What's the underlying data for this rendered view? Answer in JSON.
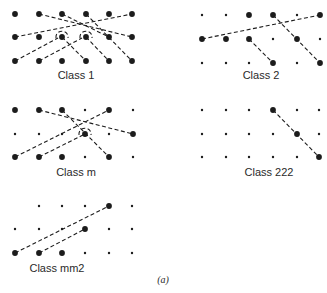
{
  "caption": "(a)",
  "colors": {
    "ink": "#1c1c1c",
    "text": "#2a2a2a",
    "background": "#ffffff"
  },
  "panels": [
    {
      "id": "class-1",
      "label": "Class 1",
      "label_pos": [
        76,
        79
      ],
      "xs": [
        15,
        39,
        62,
        86,
        109,
        132
      ],
      "ys": [
        14,
        37,
        61
      ],
      "large": [
        [
          0,
          0
        ],
        [
          1,
          0
        ],
        [
          2,
          0
        ],
        [
          3,
          0
        ],
        [
          4,
          0
        ],
        [
          5,
          0
        ],
        [
          0,
          1
        ],
        [
          1,
          1
        ],
        [
          2,
          1
        ],
        [
          3,
          1
        ],
        [
          4,
          1
        ],
        [
          5,
          1
        ],
        [
          0,
          2
        ],
        [
          1,
          2
        ],
        [
          2,
          2
        ],
        [
          3,
          2
        ],
        [
          4,
          2
        ],
        [
          5,
          2
        ]
      ],
      "lines": [
        [
          [
            39,
            14
          ],
          [
            132,
            37
          ]
        ],
        [
          [
            15,
            37
          ],
          [
            132,
            14
          ]
        ],
        [
          [
            62,
            14
          ],
          [
            109,
            37
          ]
        ],
        [
          [
            62,
            37
          ],
          [
            86,
            61
          ]
        ],
        [
          [
            86,
            37
          ],
          [
            109,
            61
          ]
        ],
        [
          [
            86,
            14
          ],
          [
            132,
            61
          ]
        ],
        [
          [
            15,
            61
          ],
          [
            58,
            38
          ]
        ],
        [
          [
            39,
            61
          ],
          [
            82,
            38
          ]
        ]
      ],
      "loops": [
        [
          62,
          37
        ],
        [
          86,
          37
        ]
      ]
    },
    {
      "id": "class-2",
      "label": "Class 2",
      "label_pos": [
        261,
        79
      ],
      "xs": [
        202,
        226,
        249,
        273,
        297,
        320
      ],
      "ys": [
        15,
        39,
        63
      ],
      "large": [
        [
          2,
          0
        ],
        [
          3,
          0
        ],
        [
          5,
          0
        ],
        [
          0,
          1
        ],
        [
          1,
          1
        ],
        [
          2,
          1
        ],
        [
          4,
          1
        ],
        [
          3,
          2
        ],
        [
          5,
          2
        ]
      ],
      "lines": [
        [
          [
            202,
            39
          ],
          [
            320,
            15
          ]
        ],
        [
          [
            273,
            15
          ],
          [
            320,
            63
          ]
        ],
        [
          [
            249,
            39
          ],
          [
            273,
            63
          ]
        ]
      ],
      "loops": []
    },
    {
      "id": "class-m",
      "label": "Class m",
      "label_pos": [
        76,
        176
      ],
      "xs": [
        15,
        39,
        62,
        85,
        109,
        133
      ],
      "ys": [
        110,
        134,
        157
      ],
      "large": [
        [
          0,
          0
        ],
        [
          1,
          0
        ],
        [
          2,
          0
        ],
        [
          4,
          0
        ],
        [
          5,
          1
        ],
        [
          3,
          1
        ],
        [
          0,
          2
        ],
        [
          1,
          2
        ],
        [
          2,
          2
        ],
        [
          4,
          2
        ]
      ],
      "lines": [
        [
          [
            39,
            110
          ],
          [
            133,
            134
          ]
        ],
        [
          [
            62,
            110
          ],
          [
            109,
            157
          ]
        ],
        [
          [
            15,
            157
          ],
          [
            109,
            110
          ]
        ],
        [
          [
            39,
            157
          ],
          [
            85,
            134
          ]
        ]
      ],
      "loops": [
        [
          85,
          134
        ]
      ]
    },
    {
      "id": "class-222",
      "label": "Class 222",
      "label_pos": [
        269,
        176
      ],
      "xs": [
        202,
        226,
        249,
        273,
        297,
        319
      ],
      "ys": [
        110,
        134,
        157
      ],
      "large": [
        [
          3,
          0
        ],
        [
          4,
          1
        ],
        [
          5,
          2
        ]
      ],
      "lines": [
        [
          [
            273,
            110
          ],
          [
            319,
            157
          ]
        ]
      ],
      "loops": []
    },
    {
      "id": "class-mm2",
      "label": "Class mm2",
      "label_pos": [
        57,
        272
      ],
      "xs": [
        15,
        39,
        62,
        85,
        109,
        132
      ],
      "ys": [
        206,
        229,
        253
      ],
      "skip": [
        [
          0,
          0
        ]
      ],
      "large": [
        [
          4,
          0
        ],
        [
          3,
          1
        ],
        [
          0,
          2
        ],
        [
          1,
          2
        ],
        [
          2,
          2
        ]
      ],
      "lines": [
        [
          [
            15,
            253
          ],
          [
            109,
            206
          ]
        ],
        [
          [
            39,
            253
          ],
          [
            85,
            229
          ]
        ]
      ],
      "loops": []
    }
  ]
}
